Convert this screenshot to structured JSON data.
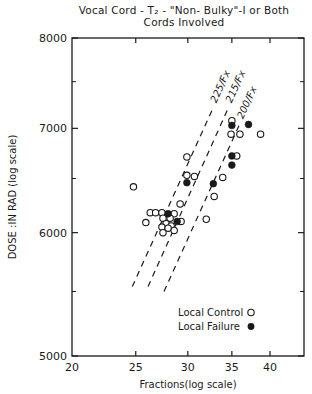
{
  "chart_data": {
    "type": "scatter",
    "title_lines": [
      "Vocal Cord - T₂ - \"Non- Bulky\"-I or Both",
      "Cords Involved"
    ],
    "xlabel": "Fractions(log scale)",
    "ylabel": "DOSE :IN RAD (log scale)",
    "xscale": "log",
    "yscale": "log",
    "xlim": [
      20,
      43.5
    ],
    "ylim": [
      5000,
      8000
    ],
    "xticks": [
      20,
      25,
      30,
      35,
      40
    ],
    "xtick_labels": [
      "20",
      "25",
      "30",
      "35",
      "40"
    ],
    "yticks": [
      5000,
      6000,
      7000,
      8000
    ],
    "ytick_labels": [
      "5000",
      "6000",
      "7000",
      "8000"
    ],
    "yminor_ticks": [
      5500,
      6500,
      7500
    ],
    "grid": false,
    "legend_position": "lower right (inside)",
    "series": [
      {
        "name": "Local Control",
        "marker": "open-circle",
        "points": [
          [
            24.8,
            6420
          ],
          [
            29.9,
            6710
          ],
          [
            29.9,
            6530
          ],
          [
            30.7,
            6520
          ],
          [
            33.9,
            6510
          ],
          [
            32.9,
            6330
          ],
          [
            29.2,
            6260
          ],
          [
            35.0,
            7080
          ],
          [
            34.9,
            6940
          ],
          [
            36.0,
            6940
          ],
          [
            38.7,
            6940
          ],
          [
            35.6,
            6720
          ],
          [
            26.3,
            6180
          ],
          [
            26.8,
            6180
          ],
          [
            27.4,
            6180
          ],
          [
            28.6,
            6170
          ],
          [
            25.9,
            6090
          ],
          [
            27.5,
            6130
          ],
          [
            28.2,
            6130
          ],
          [
            29.3,
            6100
          ],
          [
            27.8,
            6080
          ],
          [
            28.3,
            6060
          ],
          [
            27.4,
            6050
          ],
          [
            28.0,
            6040
          ],
          [
            28.6,
            6020
          ],
          [
            27.5,
            6000
          ],
          [
            32.0,
            6120
          ]
        ]
      },
      {
        "name": "Local Failure",
        "marker": "filled-circle",
        "points": [
          [
            28.0,
            6170
          ],
          [
            28.9,
            6100
          ],
          [
            29.9,
            6460
          ],
          [
            32.8,
            6450
          ],
          [
            35.0,
            6720
          ],
          [
            35.0,
            6630
          ],
          [
            35.0,
            7030
          ],
          [
            37.1,
            7040
          ]
        ]
      }
    ],
    "reference_lines": [
      {
        "label": "225/Fx",
        "style": "dashed",
        "from": [
          24.7,
          5540
        ],
        "to": [
          32.8,
          7220
        ]
      },
      {
        "label": "215/Fx",
        "style": "dashed",
        "from": [
          26.1,
          5540
        ],
        "to": [
          34.6,
          7220
        ]
      },
      {
        "label": "200/Fx",
        "style": "dashed",
        "from": [
          27.6,
          5500
        ],
        "to": [
          36.0,
          7050
        ]
      }
    ],
    "legend": [
      {
        "label": "Local Control",
        "symbol": "○"
      },
      {
        "label": "Local Failure",
        "symbol": "●"
      }
    ]
  },
  "colors": {
    "ink": "#1a1a1a",
    "background": "#ffffff"
  }
}
